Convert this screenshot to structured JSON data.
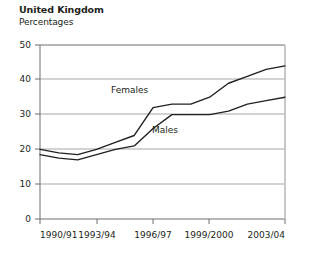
{
  "header": {
    "title": "United Kingdom",
    "subtitle": "Percentages"
  },
  "chart_data": {
    "type": "line",
    "title": "United Kingdom",
    "subtitle": "Percentages",
    "xlabel": "",
    "ylabel": "Percentages",
    "ylim": [
      0,
      50
    ],
    "yticks": [
      0,
      10,
      20,
      30,
      40,
      50
    ],
    "grid": true,
    "legend_position": "inline-annotation",
    "categories": [
      "1990/91",
      "1991/92",
      "1992/93",
      "1993/94",
      "1994/95",
      "1995/96",
      "1996/97",
      "1997/98",
      "1998/99",
      "1999/2000",
      "2000/01",
      "2001/02",
      "2002/03",
      "2003/04"
    ],
    "xtick_labels": [
      "1990/91",
      "1993/94",
      "1996/97",
      "1999/2000",
      "2003/04"
    ],
    "xtick_positions": [
      0,
      3,
      6,
      9,
      13
    ],
    "series": [
      {
        "name": "Females",
        "values": [
          20,
          19,
          18.5,
          20,
          22,
          24,
          32,
          33,
          33,
          35,
          39,
          41,
          43,
          44
        ]
      },
      {
        "name": "Males",
        "values": [
          18.5,
          17.5,
          17,
          18.5,
          20,
          21,
          26,
          30,
          30,
          30,
          31,
          33,
          34,
          35
        ]
      }
    ],
    "annotations": [
      {
        "text": "Females",
        "x": "1994/95",
        "y": 37
      },
      {
        "text": "Males",
        "x": "1996/97",
        "y": 26
      }
    ]
  },
  "colors": {
    "line": "#231f20",
    "grid": "#9d9d9d",
    "axis": "#6d6e71",
    "background": "#ffffff"
  }
}
